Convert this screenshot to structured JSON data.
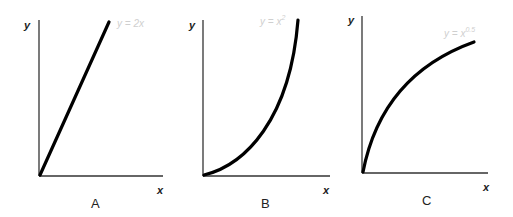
{
  "panels": [
    {
      "id": "A",
      "label": "A",
      "x_axis_label": "x",
      "y_axis_label": "y",
      "equation": {
        "base": "y = 2x",
        "exponent": ""
      }
    },
    {
      "id": "B",
      "label": "B",
      "x_axis_label": "x",
      "y_axis_label": "y",
      "equation": {
        "base": "y = x",
        "exponent": "2"
      }
    },
    {
      "id": "C",
      "label": "C",
      "x_axis_label": "x",
      "y_axis_label": "y",
      "equation": {
        "base": "y = x",
        "exponent": "0.5"
      }
    }
  ],
  "colors": {
    "curve": "#000000",
    "axis": "#333333",
    "equation_text": "#cfcfcf"
  }
}
